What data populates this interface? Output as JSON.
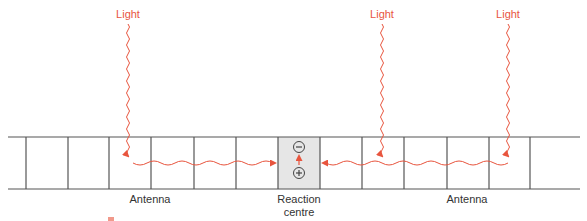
{
  "colors": {
    "light": "#e8553e",
    "line": "#555555",
    "reaction_fill": "#e6e6e6",
    "text": "#333333"
  },
  "membrane": {
    "x_start": 8,
    "x_end": 580,
    "y_top": 137,
    "y_bottom": 189,
    "dividers": [
      26,
      68,
      109,
      151,
      194,
      236,
      278,
      320,
      362,
      404,
      447,
      489,
      530
    ],
    "reaction_centre": {
      "x1": 278,
      "x2": 320
    }
  },
  "light_sources": [
    {
      "label": "Light",
      "x": 128,
      "label_y": 8,
      "wave_top": 24,
      "arrow_tip": 157
    },
    {
      "label": "Light",
      "x": 382,
      "label_y": 8,
      "wave_top": 24,
      "arrow_tip": 157
    },
    {
      "label": "Light",
      "x": 508,
      "label_y": 8,
      "wave_top": 24,
      "arrow_tip": 157
    }
  ],
  "energy_transfer": {
    "left": {
      "from_x": 133,
      "to_x": 275,
      "y": 163
    },
    "right": {
      "from_x": 508,
      "to_x": 323,
      "y": 163
    }
  },
  "reaction_centre": {
    "minus_symbol": "−",
    "plus_symbol": "+",
    "minus_y": 147,
    "plus_y": 173,
    "cx": 299
  },
  "labels": {
    "antenna_left": "Antenna",
    "reaction_centre_line1": "Reaction",
    "reaction_centre_line2": "centre",
    "antenna_right": "Antenna"
  }
}
